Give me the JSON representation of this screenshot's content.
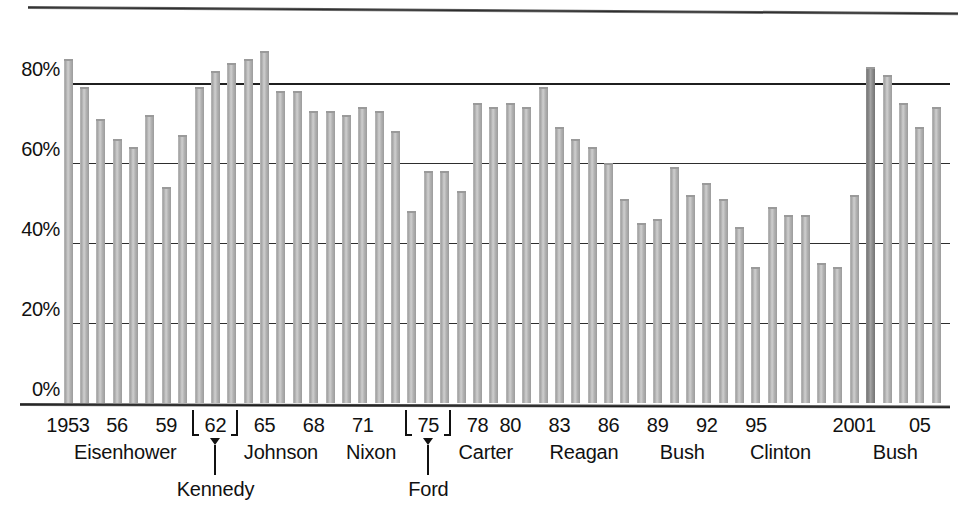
{
  "chart_data": {
    "type": "bar",
    "title": "",
    "subtitle": "",
    "xlabel": "",
    "ylabel": "",
    "ylim": [
      0,
      100
    ],
    "ytick_values": [
      0,
      20,
      40,
      60,
      80
    ],
    "ytick_labels": [
      "0%",
      "20%",
      "40%",
      "60%",
      "80%"
    ],
    "grid": "horizontal",
    "legend": "none",
    "x_start_year": 1953,
    "x_end_year": 2006,
    "categories": [
      1953,
      1954,
      1955,
      1956,
      1957,
      1958,
      1959,
      1960,
      1961,
      1962,
      1963,
      1964,
      1965,
      1966,
      1967,
      1968,
      1969,
      1970,
      1971,
      1972,
      1973,
      1974,
      1975,
      1976,
      1977,
      1978,
      1979,
      1980,
      1981,
      1982,
      1983,
      1984,
      1985,
      1986,
      1987,
      1988,
      1989,
      1990,
      1991,
      1992,
      1993,
      1994,
      1995,
      1996,
      1997,
      1998,
      1999,
      2000,
      2001,
      2002,
      2003,
      2004,
      2005,
      2006
    ],
    "values": [
      86,
      79,
      71,
      66,
      64,
      72,
      54,
      67,
      79,
      83,
      85,
      86,
      88,
      78,
      78,
      73,
      73,
      72,
      74,
      73,
      68,
      48,
      58,
      58,
      53,
      75,
      74,
      75,
      74,
      79,
      69,
      66,
      64,
      60,
      51,
      45,
      46,
      59,
      52,
      55,
      51,
      44,
      34,
      49,
      47,
      47,
      35,
      34,
      52,
      84,
      82,
      75,
      69,
      74
    ],
    "highlight_bars": [
      2002
    ],
    "highlight_note": "2002 bar rendered in a darker tone",
    "eras": [
      {
        "president": "Eisenhower",
        "start": 1953,
        "end": 1960
      },
      {
        "president": "Kennedy",
        "start": 1961,
        "end": 1963
      },
      {
        "president": "Johnson",
        "start": 1964,
        "end": 1968
      },
      {
        "president": "Nixon",
        "start": 1969,
        "end": 1974
      },
      {
        "president": "Ford",
        "start": 1975,
        "end": 1976
      },
      {
        "president": "Carter",
        "start": 1977,
        "end": 1980
      },
      {
        "president": "Reagan",
        "start": 1981,
        "end": 1988
      },
      {
        "president": "Bush",
        "start": 1989,
        "end": 1992
      },
      {
        "president": "Clinton",
        "start": 1993,
        "end": 2000
      },
      {
        "president": "Bush",
        "start": 2001,
        "end": 2006
      }
    ],
    "xtick_labels": [
      "1953",
      "56",
      "59",
      "62",
      "65",
      "68",
      "71",
      "75",
      "78",
      "80",
      "83",
      "86",
      "89",
      "92",
      "95",
      "2001",
      "05"
    ],
    "bracketed_xticks": [
      "62",
      "75"
    ],
    "colors": {
      "bar": "#b4b4b4",
      "bar_highlight": "#8a8a8a",
      "gridline": "#2e2e2e",
      "axis": "#1c1c1c",
      "text": "#111111",
      "background": "#ffffff"
    }
  },
  "axis": {
    "y_ticks": [
      {
        "label": "80%",
        "value": 80
      },
      {
        "label": "60%",
        "value": 60
      },
      {
        "label": "40%",
        "value": 40
      },
      {
        "label": "20%",
        "value": 20
      },
      {
        "label": "0%",
        "value": 0
      }
    ],
    "x_ticks": [
      {
        "label": "1953",
        "year": 1953
      },
      {
        "label": "56",
        "year": 1956
      },
      {
        "label": "59",
        "year": 1959
      },
      {
        "label": "62",
        "year": 1962,
        "bracketed": true
      },
      {
        "label": "65",
        "year": 1965
      },
      {
        "label": "68",
        "year": 1968
      },
      {
        "label": "71",
        "year": 1971
      },
      {
        "label": "75",
        "year": 1975,
        "bracketed": true
      },
      {
        "label": "78",
        "year": 1978
      },
      {
        "label": "80",
        "year": 1980
      },
      {
        "label": "83",
        "year": 1983
      },
      {
        "label": "86",
        "year": 1986
      },
      {
        "label": "89",
        "year": 1989
      },
      {
        "label": "92",
        "year": 1992
      },
      {
        "label": "95",
        "year": 1995
      },
      {
        "label": "2001",
        "year": 2001
      },
      {
        "label": "05",
        "year": 2005
      }
    ],
    "presidents": [
      {
        "name": "Eisenhower",
        "center_year": 1956.5,
        "row": "main"
      },
      {
        "name": "Kennedy",
        "center_year": 1962.0,
        "row": "low"
      },
      {
        "name": "Johnson",
        "center_year": 1966.0,
        "row": "main"
      },
      {
        "name": "Nixon",
        "center_year": 1971.5,
        "row": "main"
      },
      {
        "name": "Ford",
        "center_year": 1975.0,
        "row": "low"
      },
      {
        "name": "Carter",
        "center_year": 1978.5,
        "row": "main"
      },
      {
        "name": "Reagan",
        "center_year": 1984.5,
        "row": "main"
      },
      {
        "name": "Bush",
        "center_year": 1990.5,
        "row": "main"
      },
      {
        "name": "Clinton",
        "center_year": 1996.5,
        "row": "main"
      },
      {
        "name": "Bush",
        "center_year": 2003.5,
        "row": "main"
      }
    ]
  }
}
